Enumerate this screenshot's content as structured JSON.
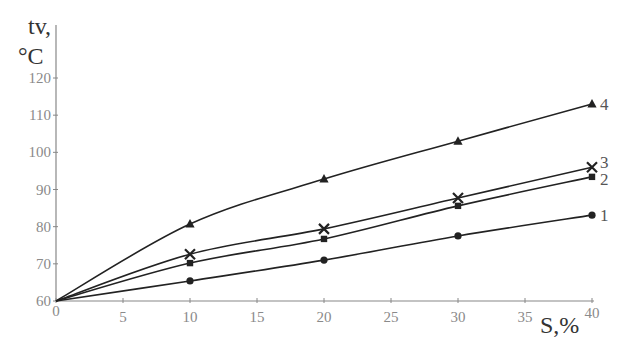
{
  "chart_data": {
    "type": "line",
    "title": "",
    "xlabel": "S,%",
    "ylabel_line1": "tv,",
    "ylabel_line2": "°C",
    "xlim": [
      0,
      40
    ],
    "ylim": [
      60,
      120
    ],
    "x_ticks": [
      0,
      5,
      10,
      15,
      20,
      25,
      30,
      35,
      40
    ],
    "y_ticks": [
      60,
      70,
      80,
      90,
      100,
      110,
      120
    ],
    "grid": false,
    "legend": "inline labels at right end of each curve",
    "x": [
      0,
      10,
      20,
      30,
      40
    ],
    "series": [
      {
        "name": "1",
        "marker": "circle",
        "values": [
          60,
          65.4,
          71.0,
          77.5,
          83.1
        ]
      },
      {
        "name": "2",
        "marker": "square",
        "values": [
          60,
          70.2,
          76.7,
          85.6,
          93.4
        ]
      },
      {
        "name": "3",
        "marker": "x",
        "values": [
          60,
          72.6,
          79.4,
          87.7,
          96.0
        ]
      },
      {
        "name": "4",
        "marker": "triangle",
        "values": [
          60,
          80.7,
          92.8,
          103.0,
          113.0
        ]
      }
    ],
    "colors": {
      "line": "#222222",
      "axis": "#888888",
      "text": "#888888"
    }
  }
}
